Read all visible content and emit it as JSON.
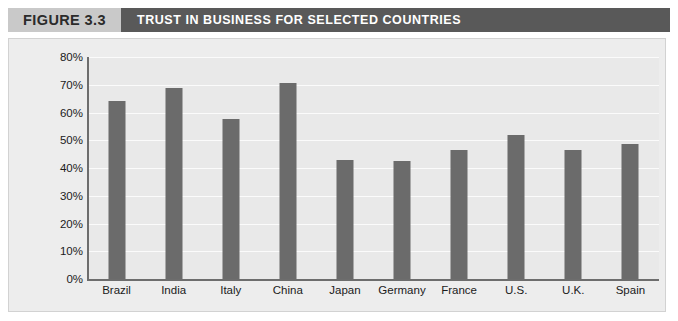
{
  "header": {
    "figure_tag": "FIGURE 3.3",
    "title": "TRUST IN BUSINESS FOR SELECTED COUNTRIES",
    "tag_bg": "#c9c9c9",
    "title_bg": "#595959",
    "title_color": "#ffffff"
  },
  "chart_data": {
    "type": "bar",
    "title": "TRUST IN BUSINESS FOR SELECTED COUNTRIES",
    "xlabel": "",
    "ylabel": "",
    "ylim": [
      0,
      80
    ],
    "ytick_step": 10,
    "grid": true,
    "legend": "none",
    "value_suffix": "%",
    "bar_color": "#6b6b6b",
    "plot_bg": "#e9e9e9",
    "gridline_color": "#fbfbfb",
    "ytick_labels": [
      "80%",
      "70%",
      "60%",
      "50%",
      "40%",
      "30%",
      "20%",
      "10%",
      "0%"
    ],
    "ytick_values": [
      80,
      70,
      60,
      50,
      40,
      30,
      20,
      10,
      0
    ],
    "categories": [
      "Brazil",
      "India",
      "Italy",
      "China",
      "Japan",
      "Germany",
      "France",
      "U.S.",
      "U.K.",
      "Spain"
    ],
    "values": [
      64,
      69,
      57.5,
      70.5,
      43,
      42.5,
      46.5,
      52,
      46.5,
      48.5
    ]
  }
}
